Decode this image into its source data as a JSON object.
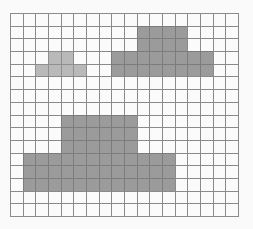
{
  "board": {
    "columns": 18,
    "rows": 16,
    "colors": {
      "background": "#fafafa",
      "empty": "#fbfbfb",
      "grid_line": "#8a8a8a",
      "dark": "#9b9b9b",
      "light": "#b9b9b9"
    },
    "filled_regions": [
      {
        "name": "top-right-shape-upper",
        "shade": "dark",
        "row_start": 1,
        "row_end": 2,
        "col_start": 10,
        "col_end": 13
      },
      {
        "name": "top-right-shape-lower",
        "shade": "dark",
        "row_start": 3,
        "row_end": 4,
        "col_start": 8,
        "col_end": 15
      },
      {
        "name": "top-left-shape-upper",
        "shade": "light",
        "row_start": 3,
        "row_end": 3,
        "col_start": 3,
        "col_end": 4
      },
      {
        "name": "top-left-shape-lower",
        "shade": "light",
        "row_start": 4,
        "row_end": 4,
        "col_start": 2,
        "col_end": 5
      },
      {
        "name": "bottom-shape-upper",
        "shade": "dark",
        "row_start": 8,
        "row_end": 10,
        "col_start": 4,
        "col_end": 9
      },
      {
        "name": "bottom-shape-lower",
        "shade": "dark",
        "row_start": 11,
        "row_end": 13,
        "col_start": 1,
        "col_end": 12
      }
    ]
  }
}
